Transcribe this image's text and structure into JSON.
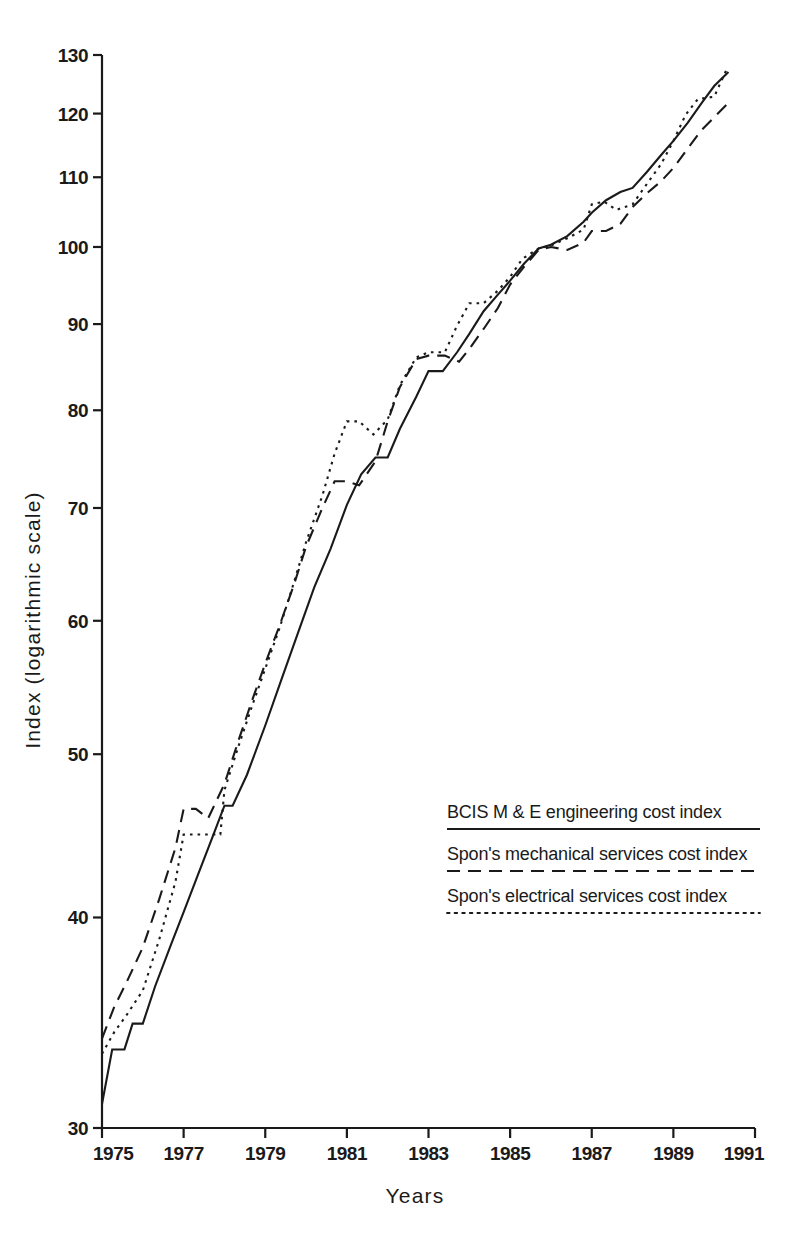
{
  "chart_data": {
    "type": "line",
    "title": "",
    "xlabel": "Years",
    "ylabel": "Index (logarithmic scale)",
    "yscale": "log",
    "ylim": [
      30,
      130
    ],
    "xlim": [
      1975,
      1991
    ],
    "yticks": [
      30,
      40,
      50,
      60,
      70,
      80,
      90,
      100,
      110,
      120,
      130
    ],
    "ytick_labels": [
      "30",
      "40",
      "50",
      "60",
      "70",
      "80",
      "90",
      "100",
      "110",
      "120",
      "130"
    ],
    "xticks": [
      1975,
      1977,
      1979,
      1981,
      1983,
      1985,
      1987,
      1989,
      1991
    ],
    "xtick_labels": [
      "1975",
      "1977",
      "1979",
      "1981",
      "1983",
      "1985",
      "1987",
      "1989",
      "1991"
    ],
    "grid": false,
    "legend_position": "center-right",
    "series": [
      {
        "name": "BCIS M & E engineering cost index",
        "style": "solid",
        "points": [
          [
            1975.0,
            31.0
          ],
          [
            1975.25,
            33.4
          ],
          [
            1975.55,
            33.4
          ],
          [
            1975.75,
            34.6
          ],
          [
            1976.0,
            34.6
          ],
          [
            1976.3,
            36.4
          ],
          [
            1976.7,
            38.6
          ],
          [
            1977.0,
            40.3
          ],
          [
            1977.35,
            42.4
          ],
          [
            1977.7,
            44.6
          ],
          [
            1978.0,
            46.6
          ],
          [
            1978.2,
            46.6
          ],
          [
            1978.55,
            48.6
          ],
          [
            1979.0,
            52.0
          ],
          [
            1979.4,
            55.4
          ],
          [
            1979.8,
            59.0
          ],
          [
            1980.2,
            62.8
          ],
          [
            1980.6,
            66.2
          ],
          [
            1981.0,
            70.3
          ],
          [
            1981.35,
            73.3
          ],
          [
            1981.7,
            75.0
          ],
          [
            1982.0,
            75.0
          ],
          [
            1982.3,
            78.0
          ],
          [
            1982.7,
            81.5
          ],
          [
            1983.0,
            84.4
          ],
          [
            1983.35,
            84.4
          ],
          [
            1983.7,
            86.6
          ],
          [
            1984.0,
            88.8
          ],
          [
            1984.35,
            91.6
          ],
          [
            1984.7,
            93.7
          ],
          [
            1985.0,
            95.5
          ],
          [
            1985.35,
            97.8
          ],
          [
            1985.7,
            99.8
          ],
          [
            1986.0,
            100.3
          ],
          [
            1986.4,
            101.5
          ],
          [
            1986.8,
            103.5
          ],
          [
            1987.0,
            104.8
          ],
          [
            1987.35,
            106.6
          ],
          [
            1987.7,
            107.8
          ],
          [
            1988.0,
            108.4
          ],
          [
            1988.35,
            110.8
          ],
          [
            1988.7,
            113.4
          ],
          [
            1989.0,
            115.6
          ],
          [
            1989.35,
            118.5
          ],
          [
            1989.7,
            121.8
          ],
          [
            1990.0,
            124.6
          ],
          [
            1990.35,
            127.0
          ]
        ]
      },
      {
        "name": "Spon's mechanical services cost index",
        "style": "dashed",
        "points": [
          [
            1975.0,
            33.9
          ],
          [
            1975.3,
            35.4
          ],
          [
            1975.6,
            36.6
          ],
          [
            1976.0,
            38.4
          ],
          [
            1976.4,
            41.0
          ],
          [
            1976.8,
            44.0
          ],
          [
            1977.0,
            46.4
          ],
          [
            1977.3,
            46.4
          ],
          [
            1977.6,
            45.8
          ],
          [
            1978.0,
            48.0
          ],
          [
            1978.35,
            51.0
          ],
          [
            1978.7,
            54.0
          ],
          [
            1979.0,
            56.6
          ],
          [
            1979.35,
            59.6
          ],
          [
            1979.7,
            63.0
          ],
          [
            1980.0,
            66.4
          ],
          [
            1980.4,
            70.0
          ],
          [
            1980.7,
            72.6
          ],
          [
            1981.0,
            72.6
          ],
          [
            1981.3,
            72.2
          ],
          [
            1981.7,
            74.6
          ],
          [
            1982.0,
            78.8
          ],
          [
            1982.3,
            82.6
          ],
          [
            1982.7,
            85.8
          ],
          [
            1983.0,
            86.2
          ],
          [
            1983.4,
            86.2
          ],
          [
            1983.75,
            85.5
          ],
          [
            1984.0,
            87.0
          ],
          [
            1984.35,
            89.4
          ],
          [
            1984.7,
            92.0
          ],
          [
            1985.0,
            95.0
          ],
          [
            1985.35,
            97.4
          ],
          [
            1985.7,
            99.6
          ],
          [
            1986.0,
            100.0
          ],
          [
            1986.4,
            99.6
          ],
          [
            1986.8,
            100.6
          ],
          [
            1987.0,
            102.2
          ],
          [
            1987.35,
            102.2
          ],
          [
            1987.7,
            103.2
          ],
          [
            1988.0,
            105.6
          ],
          [
            1988.35,
            107.6
          ],
          [
            1988.7,
            109.4
          ],
          [
            1989.0,
            111.4
          ],
          [
            1989.35,
            114.4
          ],
          [
            1989.7,
            117.4
          ],
          [
            1990.0,
            119.4
          ],
          [
            1990.35,
            121.8
          ]
        ]
      },
      {
        "name": "Spon's electrical services cost index",
        "style": "dotted",
        "points": [
          [
            1975.0,
            33.2
          ],
          [
            1975.3,
            34.2
          ],
          [
            1975.6,
            35.0
          ],
          [
            1976.0,
            36.2
          ],
          [
            1976.4,
            38.8
          ],
          [
            1976.8,
            42.0
          ],
          [
            1977.0,
            44.8
          ],
          [
            1977.3,
            44.8
          ],
          [
            1977.6,
            44.8
          ],
          [
            1977.9,
            44.8
          ],
          [
            1978.0,
            47.6
          ],
          [
            1978.35,
            50.6
          ],
          [
            1978.7,
            53.6
          ],
          [
            1979.0,
            56.2
          ],
          [
            1979.35,
            59.4
          ],
          [
            1979.7,
            63.2
          ],
          [
            1980.0,
            66.8
          ],
          [
            1980.4,
            71.2
          ],
          [
            1980.7,
            75.4
          ],
          [
            1981.0,
            78.8
          ],
          [
            1981.3,
            78.8
          ],
          [
            1981.65,
            77.4
          ],
          [
            1982.0,
            79.0
          ],
          [
            1982.3,
            82.8
          ],
          [
            1982.7,
            86.0
          ],
          [
            1983.0,
            86.6
          ],
          [
            1983.4,
            86.6
          ],
          [
            1983.7,
            89.8
          ],
          [
            1984.0,
            92.6
          ],
          [
            1984.35,
            92.6
          ],
          [
            1984.7,
            94.2
          ],
          [
            1985.0,
            96.0
          ],
          [
            1985.3,
            98.4
          ],
          [
            1985.7,
            99.8
          ],
          [
            1986.0,
            100.2
          ],
          [
            1986.4,
            101.2
          ],
          [
            1986.8,
            102.4
          ],
          [
            1987.0,
            106.0
          ],
          [
            1987.3,
            106.4
          ],
          [
            1987.6,
            105.2
          ],
          [
            1988.0,
            106.0
          ],
          [
            1988.35,
            109.0
          ],
          [
            1988.7,
            112.0
          ],
          [
            1989.0,
            115.6
          ],
          [
            1989.3,
            119.8
          ],
          [
            1989.6,
            122.4
          ],
          [
            1990.0,
            122.8
          ],
          [
            1990.3,
            127.4
          ]
        ]
      }
    ]
  },
  "legend": {
    "entries": [
      {
        "label": "BCIS M & E engineering cost index",
        "style": "solid"
      },
      {
        "label": "Spon's mechanical services cost index",
        "style": "dashed"
      },
      {
        "label": "Spon's electrical services cost index",
        "style": "dotted"
      }
    ]
  }
}
